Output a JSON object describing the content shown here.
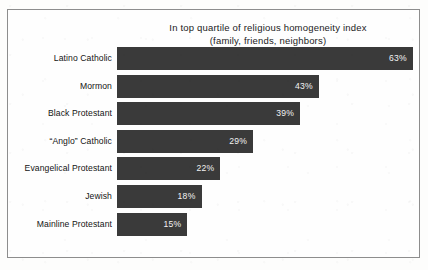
{
  "chart_data": {
    "type": "bar",
    "orientation": "horizontal",
    "title": "In top quartile of religious homogeneity index",
    "subtitle": "(family, friends, neighbors)",
    "xlabel": "",
    "ylabel": "",
    "xlim": [
      0,
      63
    ],
    "grid": false,
    "legend": "none",
    "value_suffix": "%",
    "categories": [
      "Latino Catholic",
      "Mormon",
      "Black Protestant",
      "“Anglo” Catholic",
      "Evangelical Protestant",
      "Jewish",
      "Mainline Protestant"
    ],
    "values": [
      63,
      43,
      39,
      29,
      22,
      18,
      15
    ],
    "value_labels": [
      "63%",
      "43%",
      "39%",
      "29%",
      "22%",
      "18%",
      "15%"
    ],
    "bar_color": "#3a3a3a",
    "value_label_color": "#f2f2f2",
    "background_color": "#fefefe",
    "border_color": "#8d8d8d"
  }
}
